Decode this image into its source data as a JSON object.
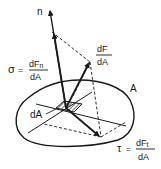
{
  "diagram": {
    "type": "stress-vector-decomposition",
    "labels": {
      "normal": "n",
      "area_region": "A",
      "area_element": "dA",
      "sigma_symbol": "σ",
      "sigma_eq": "=",
      "sigma_num": "dFn",
      "sigma_num_base": "dF",
      "sigma_num_sub": "n",
      "sigma_den": "dA",
      "stress_num": "dF",
      "stress_den": "dA",
      "tau_symbol": "τ",
      "tau_eq": "=",
      "tau_num_base": "dF",
      "tau_num_sub": "t",
      "tau_den": "dA"
    },
    "colors": {
      "ink": "#1a1a1a",
      "background": "#ffffff"
    }
  }
}
